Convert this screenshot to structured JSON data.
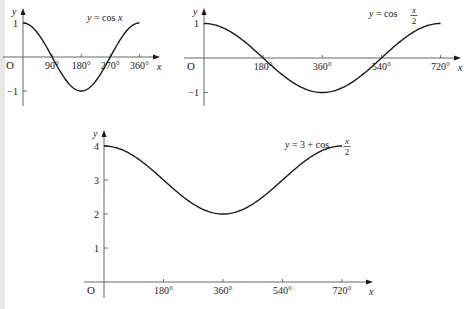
{
  "chart_data": [
    {
      "type": "line",
      "title": "y = cos x",
      "title_parts": {
        "lhs": "y = cos ",
        "var": "x"
      },
      "xlabel": "x",
      "ylabel": "y",
      "origin_label": "O",
      "x_ticks": [
        90,
        180,
        270,
        360
      ],
      "x_tick_labels": [
        "90°",
        "180°",
        "270°",
        "360°"
      ],
      "y_ticks": [
        1,
        -1
      ],
      "y_tick_labels": [
        "1",
        "−1"
      ],
      "xlim": [
        0,
        360
      ],
      "ylim": [
        -1,
        1
      ],
      "x": [
        0,
        45,
        90,
        135,
        180,
        225,
        270,
        315,
        360
      ],
      "values": [
        1,
        0.707,
        0,
        -0.707,
        -1,
        -0.707,
        0,
        0.707,
        1
      ],
      "grid": false,
      "layout": {
        "x0": 23,
        "y0": 57,
        "px_per_deg": 0.3233,
        "px_per_unit": 34,
        "x_end": 160,
        "y_top": 8,
        "y_bottom": 106
      }
    },
    {
      "type": "line",
      "title": "y = cos x/2",
      "title_parts": {
        "lhs": "y = cos ",
        "num": "x",
        "den": "2"
      },
      "xlabel": "x",
      "ylabel": "y",
      "origin_label": "O",
      "x_ticks": [
        180,
        360,
        540,
        720
      ],
      "x_tick_labels": [
        "180°",
        "360°",
        "540°",
        "720°"
      ],
      "y_ticks": [
        1,
        -1
      ],
      "y_tick_labels": [
        "1",
        "−1"
      ],
      "xlim": [
        0,
        720
      ],
      "ylim": [
        -1,
        1
      ],
      "x": [
        0,
        90,
        180,
        270,
        360,
        450,
        540,
        630,
        720
      ],
      "values": [
        1,
        0.707,
        0,
        -0.707,
        -1,
        -0.707,
        0,
        0.707,
        1
      ],
      "grid": false,
      "layout": {
        "x0": 204,
        "y0": 58,
        "px_per_deg": 0.3286,
        "px_per_unit": 34.5,
        "x_end": 461,
        "y_top": 8,
        "y_bottom": 106
      }
    },
    {
      "type": "line",
      "title": "y = 3 + cos x/2",
      "title_parts": {
        "lhs": "y = 3 + cos ",
        "num": "x",
        "den": "2"
      },
      "xlabel": "x",
      "ylabel": "y",
      "origin_label": "O",
      "x_ticks": [
        180,
        360,
        540,
        720
      ],
      "x_tick_labels": [
        "180°",
        "360°",
        "540°",
        "720°"
      ],
      "y_ticks": [
        4,
        3,
        2,
        1
      ],
      "y_tick_labels": [
        "4",
        "3",
        "2",
        "1"
      ],
      "xlim": [
        0,
        720
      ],
      "ylim": [
        0,
        4
      ],
      "x": [
        0,
        90,
        180,
        270,
        360,
        450,
        540,
        630,
        720
      ],
      "values": [
        4,
        3.707,
        3,
        2.293,
        2,
        2.293,
        3,
        3.707,
        4
      ],
      "grid": false,
      "layout": {
        "x0": 104,
        "y0": 282,
        "px_per_deg": 0.3306,
        "px_per_unit": 34,
        "x_end": 373,
        "y_top": 130,
        "y_bottom": 298
      }
    }
  ]
}
